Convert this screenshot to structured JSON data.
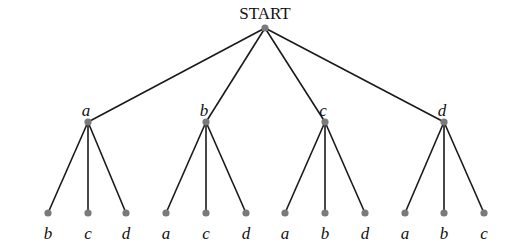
{
  "diagram": {
    "type": "tree",
    "root": {
      "label": "START",
      "x": 265,
      "y": 28
    },
    "level1": [
      {
        "label": "a",
        "x": 88,
        "y": 122,
        "children": [
          {
            "label": "b",
            "x": 48,
            "y": 213
          },
          {
            "label": "c",
            "x": 88,
            "y": 213
          },
          {
            "label": "d",
            "x": 126,
            "y": 213
          }
        ]
      },
      {
        "label": "b",
        "x": 206,
        "y": 122,
        "children": [
          {
            "label": "a",
            "x": 166,
            "y": 213
          },
          {
            "label": "c",
            "x": 206,
            "y": 213
          },
          {
            "label": "d",
            "x": 246,
            "y": 213
          }
        ]
      },
      {
        "label": "c",
        "x": 325,
        "y": 122,
        "children": [
          {
            "label": "a",
            "x": 285,
            "y": 213
          },
          {
            "label": "b",
            "x": 325,
            "y": 213
          },
          {
            "label": "d",
            "x": 365,
            "y": 213
          }
        ]
      },
      {
        "label": "d",
        "x": 444,
        "y": 122,
        "children": [
          {
            "label": "a",
            "x": 405,
            "y": 213
          },
          {
            "label": "b",
            "x": 444,
            "y": 213
          },
          {
            "label": "c",
            "x": 484,
            "y": 213
          }
        ]
      }
    ],
    "colors": {
      "edge": "#1a1a1a",
      "node": "#7a7a7a",
      "text": "#111111"
    }
  }
}
